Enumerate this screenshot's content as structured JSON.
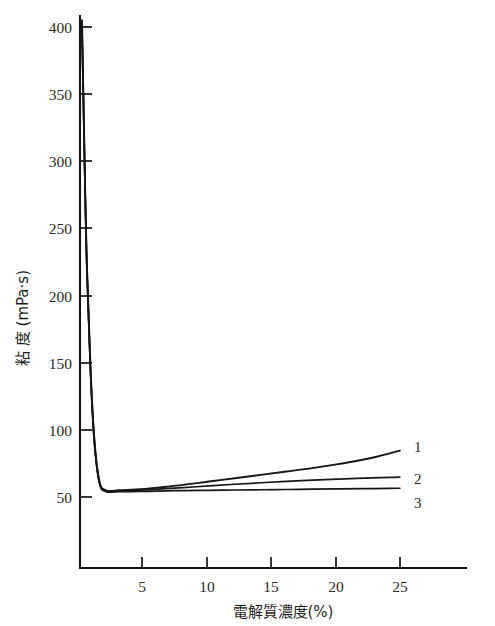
{
  "chart_data": {
    "type": "line",
    "title": "",
    "xlabel": "電解質濃度(%)",
    "ylabel": "粘 度 (mPa·s)",
    "xlim": [
      0,
      27
    ],
    "ylim": [
      0,
      415
    ],
    "grid": false,
    "legend_position": "right-end-of-curves",
    "x_ticks": [
      5,
      10,
      15,
      20,
      25
    ],
    "x_tick_labels": [
      "5",
      "10",
      "15",
      "20",
      "25"
    ],
    "y_ticks": [
      50,
      100,
      150,
      200,
      250,
      300,
      350,
      400
    ],
    "y_tick_labels": [
      "50",
      "100",
      "150",
      "200",
      "250",
      "300",
      "350",
      "400"
    ],
    "series": [
      {
        "name": "1",
        "label": "1",
        "x": [
          0.15,
          0.3,
          0.5,
          0.8,
          1.1,
          1.5,
          2.0,
          3.0,
          4.0,
          5.0,
          6.0,
          8.0,
          10.0,
          12.0,
          14.0,
          16.0,
          18.0,
          20.0,
          21.5,
          23.0,
          24.0,
          24.8
        ],
        "y": [
          405,
          330,
          235,
          150,
          95,
          62,
          55,
          55,
          55.5,
          56,
          57,
          59,
          61.5,
          64,
          66.5,
          69,
          71.5,
          74.5,
          77,
          80,
          82.5,
          84.5
        ]
      },
      {
        "name": "2",
        "label": "2",
        "x": [
          0.15,
          0.3,
          0.5,
          0.8,
          1.1,
          1.5,
          2.0,
          3.0,
          4.0,
          5.0,
          6.0,
          8.0,
          10.0,
          12.0,
          14.0,
          16.0,
          18.0,
          20.0,
          22.0,
          24.0,
          24.8
        ],
        "y": [
          403,
          328,
          233,
          148,
          93,
          61,
          54.5,
          54.5,
          55,
          55.3,
          55.8,
          57,
          58.3,
          59.5,
          60.6,
          61.6,
          62.5,
          63.3,
          64.0,
          64.6,
          64.9
        ]
      },
      {
        "name": "3",
        "label": "3",
        "x": [
          0.15,
          0.3,
          0.5,
          0.8,
          1.1,
          1.5,
          2.0,
          3.0,
          4.0,
          5.0,
          6.0,
          8.0,
          10.0,
          12.0,
          14.0,
          16.0,
          18.0,
          20.0,
          22.0,
          24.0,
          24.8
        ],
        "y": [
          401,
          326,
          231,
          146,
          92,
          60.5,
          54,
          54,
          54,
          54.2,
          54.4,
          54.8,
          55.0,
          55.2,
          55.4,
          55.6,
          55.8,
          56.0,
          56.2,
          56.4,
          56.5
        ]
      }
    ],
    "annotations": [
      {
        "text": "1",
        "x": 25.8,
        "y": 84
      },
      {
        "text": "2",
        "x": 25.8,
        "y": 65
      },
      {
        "text": "3",
        "x": 25.8,
        "y": 54
      }
    ]
  },
  "axes": {
    "y_title": "粘 度 (mPa·s)",
    "x_title": "電解質濃度(%)",
    "y_tick_labels": [
      "400",
      "350",
      "300",
      "250",
      "200",
      "150",
      "100",
      "50"
    ],
    "x_tick_labels": [
      "5",
      "10",
      "15",
      "20",
      "25"
    ]
  },
  "curve_labels": {
    "one": "1",
    "two": "2",
    "three": "3"
  }
}
